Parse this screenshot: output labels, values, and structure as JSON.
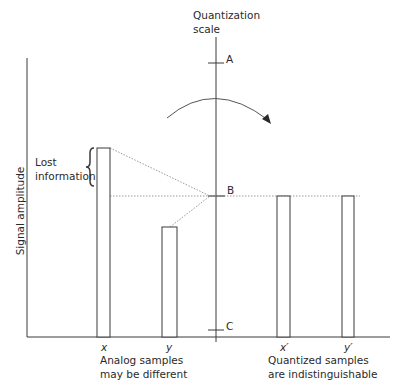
{
  "diagram": {
    "scale_label_line1": "Quantization",
    "scale_label_line2": "scale",
    "y_axis_label": "Signal amplitude",
    "levels": [
      {
        "label": "A",
        "y": 63
      },
      {
        "label": "B",
        "y": 196
      },
      {
        "label": "C",
        "y": 330
      }
    ],
    "annotation": {
      "line1": "Lost",
      "line2": "information"
    },
    "samples": [
      {
        "label": "x",
        "type": "analog",
        "top": 148
      },
      {
        "label": "y",
        "type": "analog",
        "top": 227
      },
      {
        "label": "x′",
        "type": "quantized",
        "top": 196
      },
      {
        "label": "y′",
        "type": "quantized",
        "top": 196
      }
    ],
    "captions": {
      "analog_line1": "Analog samples",
      "analog_line2": "may be different",
      "quantized_line1": "Quantized samples",
      "quantized_line2": "are indistinguishable"
    },
    "colors": {
      "line": "#3a3a3a",
      "dotted": "#9a9a9a",
      "text": "#2a2a2a"
    }
  }
}
